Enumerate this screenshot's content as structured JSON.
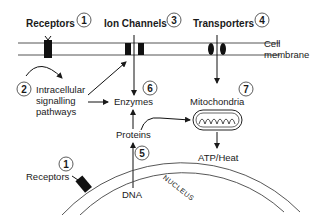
{
  "diagram": {
    "title_labels": {
      "receptors": "Receptors",
      "ion_channels": "Ion Channels",
      "transporters": "Transporters"
    },
    "badges": {
      "receptors_top": "1",
      "intracellular": "2",
      "ion_channels": "3",
      "transporters": "4",
      "proteins": "5",
      "enzymes": "6",
      "mitochondria": "7",
      "receptors_nucleus": "1"
    },
    "labels": {
      "cell_membrane_line1": "Cell",
      "cell_membrane_line2": "membrane",
      "intracellular_line1": "Intracellular",
      "intracellular_line2": "signalling",
      "intracellular_line3": "pathways",
      "enzymes": "Enzymes",
      "mitochondria": "Mitochondria",
      "proteins": "Proteins",
      "atp_heat": "ATP/Heat",
      "receptors_nucleus": "Receptors",
      "dna": "DNA",
      "nucleus": "NUCLEUS"
    },
    "colors": {
      "stroke": "#1a1a1a",
      "membrane_line": "#555555",
      "background": "#ffffff"
    }
  }
}
